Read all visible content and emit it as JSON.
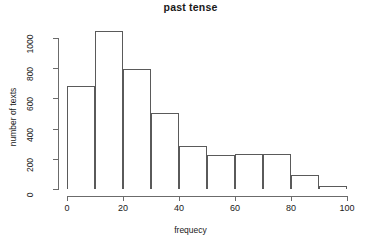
{
  "chart_data": {
    "type": "bar",
    "title": "past tense",
    "xlabel": "frequecy",
    "ylabel": "number of texts",
    "subtitle": "",
    "grid": false,
    "legend": false,
    "legend_position": "none",
    "bin_width": 10,
    "bin_edges": [
      0,
      10,
      20,
      30,
      40,
      50,
      60,
      70,
      80,
      90,
      100
    ],
    "categories": [
      "0-10",
      "10-20",
      "20-30",
      "30-40",
      "40-50",
      "50-60",
      "60-70",
      "70-80",
      "80-90",
      "90-100"
    ],
    "values": [
      685,
      1045,
      795,
      505,
      285,
      225,
      230,
      230,
      90,
      20
    ],
    "xlim": [
      0,
      100
    ],
    "ylim": [
      0,
      1050
    ],
    "xticks": [
      0,
      20,
      40,
      60,
      80,
      100
    ],
    "xtick_labels": [
      "0",
      "20",
      "40",
      "60",
      "80",
      "100"
    ],
    "yticks": [
      0,
      200,
      400,
      600,
      800,
      1000
    ],
    "ytick_labels": [
      "0",
      "200",
      "400",
      "600",
      "800",
      "1000"
    ],
    "axis_color": "#6b6b6b",
    "bar_border_color": "#5a5a5a",
    "bar_fill_color": "#ffffff",
    "background_color": "#ffffff",
    "text_color": "#1a1a1a"
  }
}
